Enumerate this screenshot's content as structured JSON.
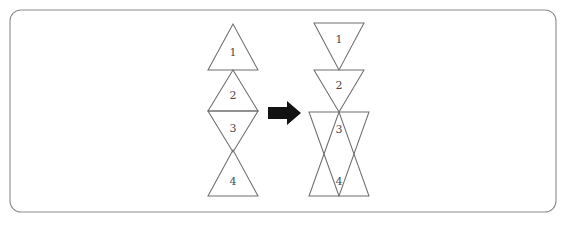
{
  "figure": {
    "title": "",
    "panel": {
      "shape": "rounded-rectangle",
      "stroke_color": "#8c8c8c",
      "x": 10,
      "y": 10,
      "width": 546,
      "height": 202,
      "corner_radius": 11
    },
    "arrow": {
      "symbol": "right-arrow",
      "color": "#121212",
      "x": 268,
      "y": 113
    },
    "left_figure": {
      "name": "source-triangle-strip",
      "center_x": 233,
      "triangles": [
        {
          "label": "1",
          "orientation": "up",
          "apex_y": 24,
          "base_y": 70,
          "half_width": 25,
          "label_x": 233,
          "label_y": 53
        },
        {
          "label": "2",
          "orientation": "up",
          "apex_y": 70,
          "base_y": 111,
          "half_width": 25,
          "label_x": 233,
          "label_y": 96
        },
        {
          "label": "3",
          "orientation": "down",
          "apex_y": 152,
          "base_y": 111,
          "half_width": 25,
          "label_x": 233,
          "label_y": 129
        },
        {
          "label": "4",
          "orientation": "up",
          "apex_y": 150,
          "base_y": 196,
          "half_width": 25,
          "label_x": 233,
          "label_y": 182
        }
      ]
    },
    "right_figure": {
      "name": "target-triangle-strip",
      "center_x": 339,
      "triangles": [
        {
          "label": "1",
          "orientation": "down",
          "apex_y": 70,
          "base_y": 23,
          "half_width": 25,
          "label_x": 339,
          "label_y": 40
        },
        {
          "label": "2",
          "orientation": "down",
          "apex_y": 112,
          "base_y": 70,
          "half_width": 25,
          "label_x": 339,
          "label_y": 86
        },
        {
          "label": "3",
          "orientation": "down",
          "apex_y": 196,
          "base_y": 112,
          "half_width": 30,
          "label_x": 339,
          "label_y": 130
        },
        {
          "label": "4",
          "orientation": "up",
          "apex_y": 112,
          "base_y": 196,
          "half_width": 30,
          "label_x": 339,
          "label_y": 182
        }
      ]
    }
  },
  "chart_data": {
    "type": "diagram",
    "left_labels": [
      "1",
      "2",
      "3",
      "4"
    ],
    "left_orientations": [
      "up",
      "up",
      "down",
      "up"
    ],
    "right_labels": [
      "1",
      "2",
      "3",
      "4"
    ],
    "right_orientations": [
      "down",
      "down",
      "down",
      "up"
    ],
    "connector": "right-arrow",
    "stroke_color": "#6f6f72",
    "label_color": "#4a4a4d"
  }
}
